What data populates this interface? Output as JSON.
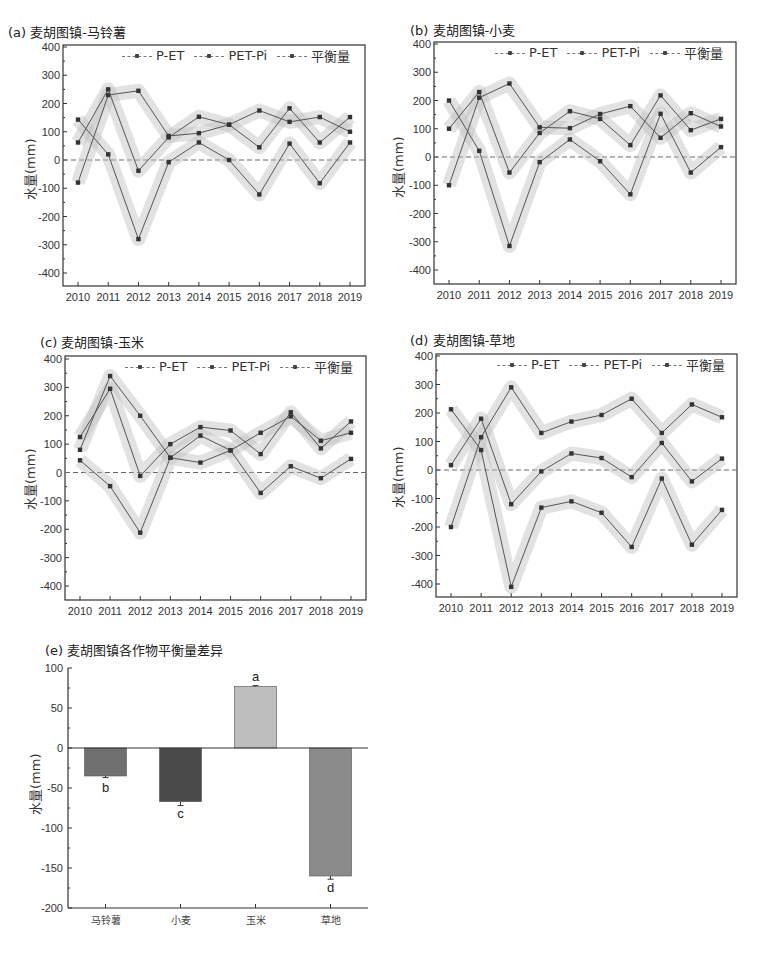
{
  "chart_data": [
    {
      "id": "a",
      "type": "line",
      "title": "(a) 麦胡图镇-马铃薯",
      "xlabel": "",
      "ylabel": "水量(mm)",
      "x": [
        2010,
        2011,
        2012,
        2013,
        2014,
        2015,
        2016,
        2017,
        2018,
        2019
      ],
      "ylim": [
        -450,
        400
      ],
      "yticks": [
        400,
        300,
        200,
        100,
        0,
        -100,
        -200,
        -300,
        -400
      ],
      "legend": [
        "P-ET",
        "PET-Pi",
        "平衡量"
      ],
      "legend_position": "top-right",
      "reference_line": 0,
      "series": [
        {
          "name": "P-ET",
          "values": [
            143,
            20,
            -280,
            -8,
            62,
            0,
            -122,
            58,
            -82,
            62
          ]
        },
        {
          "name": "PET-Pi",
          "values": [
            -80,
            230,
            245,
            85,
            95,
            125,
            175,
            135,
            152,
            100
          ]
        },
        {
          "name": "平衡量",
          "values": [
            62,
            250,
            -38,
            80,
            153,
            125,
            45,
            183,
            62,
            152
          ]
        }
      ]
    },
    {
      "id": "b",
      "type": "line",
      "title": "(b) 麦胡图镇-小麦",
      "xlabel": "",
      "ylabel": "水量(mm)",
      "x": [
        2010,
        2011,
        2012,
        2013,
        2014,
        2015,
        2016,
        2017,
        2018,
        2019
      ],
      "ylim": [
        -450,
        400
      ],
      "yticks": [
        400,
        300,
        200,
        100,
        0,
        -100,
        -200,
        -300,
        -400
      ],
      "legend": [
        "P-ET",
        "PET-Pi",
        "平衡量"
      ],
      "legend_position": "top-right",
      "reference_line": 0,
      "series": [
        {
          "name": "P-ET",
          "values": [
            200,
            22,
            -315,
            -18,
            62,
            -15,
            -132,
            153,
            -55,
            35
          ]
        },
        {
          "name": "PET-Pi",
          "values": [
            -100,
            210,
            260,
            105,
            102,
            152,
            180,
            68,
            155,
            108
          ]
        },
        {
          "name": "平衡量",
          "values": [
            100,
            230,
            -55,
            85,
            162,
            135,
            42,
            218,
            95,
            135
          ]
        }
      ]
    },
    {
      "id": "c",
      "type": "line",
      "title": "(c) 麦胡图镇-玉米",
      "xlabel": "",
      "ylabel": "水量(mm)",
      "x": [
        2010,
        2011,
        2012,
        2013,
        2014,
        2015,
        2016,
        2017,
        2018,
        2019
      ],
      "ylim": [
        -450,
        400
      ],
      "yticks": [
        400,
        300,
        200,
        100,
        0,
        -100,
        -200,
        -300,
        -400
      ],
      "legend": [
        "P-ET",
        "PET-Pi",
        "平衡量"
      ],
      "legend_position": "top-right",
      "reference_line": 0,
      "series": [
        {
          "name": "P-ET",
          "values": [
            43,
            -48,
            -212,
            52,
            35,
            78,
            -72,
            22,
            -20,
            48
          ]
        },
        {
          "name": "PET-Pi",
          "values": [
            80,
            340,
            200,
            52,
            130,
            78,
            140,
            198,
            112,
            140
          ]
        },
        {
          "name": "平衡量",
          "values": [
            125,
            295,
            -12,
            100,
            160,
            148,
            65,
            212,
            85,
            180
          ]
        }
      ]
    },
    {
      "id": "d",
      "type": "line",
      "title": "(d) 麦胡图镇-草地",
      "xlabel": "",
      "ylabel": "水量(mm)",
      "x": [
        2010,
        2011,
        2012,
        2013,
        2014,
        2015,
        2016,
        2017,
        2018,
        2019
      ],
      "ylim": [
        -450,
        400
      ],
      "yticks": [
        400,
        300,
        200,
        100,
        0,
        -100,
        -200,
        -300,
        -400
      ],
      "legend": [
        "P-ET",
        "PET-Pi",
        "平衡量"
      ],
      "legend_position": "top-right",
      "reference_line": 0,
      "series": [
        {
          "name": "P-ET",
          "values": [
            213,
            70,
            -410,
            -132,
            -110,
            -150,
            -270,
            -30,
            -262,
            -140
          ]
        },
        {
          "name": "PET-Pi",
          "values": [
            -200,
            115,
            290,
            130,
            170,
            193,
            250,
            130,
            230,
            185
          ]
        },
        {
          "name": "平衡量",
          "values": [
            17,
            180,
            -120,
            -5,
            58,
            42,
            -25,
            95,
            -40,
            40
          ]
        }
      ]
    },
    {
      "id": "e",
      "type": "bar",
      "title": "(e) 麦胡图镇各作物平衡量差异",
      "xlabel": "",
      "ylabel": "水量(mm)",
      "categories": [
        "马铃薯",
        "小麦",
        "玉米",
        "草地"
      ],
      "values": [
        -35,
        -67,
        77,
        -160
      ],
      "errors": [
        2,
        5,
        1,
        4
      ],
      "significance_letters": [
        "b",
        "c",
        "a",
        "d"
      ],
      "bar_colors": [
        "#707070",
        "#4a4a4a",
        "#bdbdbd",
        "#8a8a8a"
      ],
      "ylim": [
        -200,
        100
      ],
      "yticks": [
        100,
        50,
        0,
        -50,
        -100,
        -150,
        -200
      ]
    }
  ],
  "colors": {
    "line": "#555555",
    "band": "#bfbfbf",
    "marker": "#333333",
    "axis": "#333333",
    "zero_line": "#666666"
  }
}
